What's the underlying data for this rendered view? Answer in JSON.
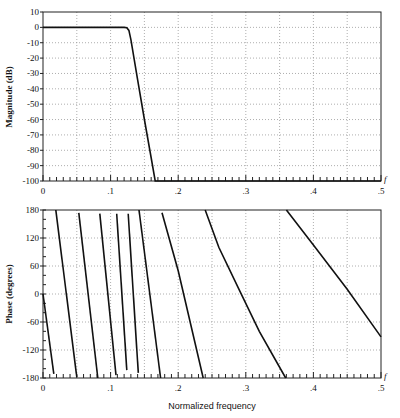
{
  "chart_data": [
    {
      "type": "line",
      "title": "",
      "xlabel": "f",
      "ylabel": "Magnitude (dB)",
      "xlim": [
        0,
        0.5
      ],
      "ylim": [
        -100,
        10
      ],
      "x_ticks": [
        "0",
        ".1",
        ".2",
        ".3",
        ".4",
        ".5"
      ],
      "y_ticks": [
        "10",
        "0",
        "-10",
        "-20",
        "-30",
        "-40",
        "-50",
        "-60",
        "-70",
        "-80",
        "-90",
        "-100"
      ],
      "grid": true,
      "series": [
        {
          "name": "magnitude",
          "points": [
            [
              0,
              0
            ],
            [
              0.12,
              0
            ],
            [
              0.124,
              -0.3
            ],
            [
              0.127,
              -2
            ],
            [
              0.13,
              -8
            ],
            [
              0.14,
              -34
            ],
            [
              0.15,
              -60
            ],
            [
              0.16,
              -85
            ],
            [
              0.166,
              -100
            ],
            [
              0.5,
              -100
            ]
          ]
        }
      ]
    },
    {
      "type": "line",
      "title": "",
      "xlabel": "Normalized frequency",
      "xlabel_end": "f",
      "ylabel": "Phase (degrees)",
      "xlim": [
        0,
        0.5
      ],
      "ylim": [
        -180,
        180
      ],
      "x_ticks": [
        "0",
        ".1",
        ".2",
        ".3",
        ".4",
        ".5"
      ],
      "y_ticks": [
        "180",
        "120",
        "60",
        "0",
        "-60",
        "-120",
        "-180"
      ],
      "grid": true,
      "series": [
        {
          "name": "phase-seg-1",
          "points": [
            [
              0,
              0
            ],
            [
              0.016,
              -171
            ]
          ]
        },
        {
          "name": "phase-seg-2",
          "points": [
            [
              0.019,
              180
            ],
            [
              0.05,
              -178
            ]
          ]
        },
        {
          "name": "phase-seg-3",
          "points": [
            [
              0.053,
              174
            ],
            [
              0.081,
              -180
            ]
          ]
        },
        {
          "name": "phase-seg-4",
          "points": [
            [
              0.084,
              172
            ],
            [
              0.108,
              -174
            ]
          ]
        },
        {
          "name": "phase-seg-5",
          "points": [
            [
              0.109,
              172
            ],
            [
              0.124,
              -163
            ]
          ]
        },
        {
          "name": "phase-seg-6",
          "points": [
            [
              0.126,
              172
            ],
            [
              0.141,
              -169
            ]
          ]
        },
        {
          "name": "phase-seg-7",
          "points": [
            [
              0.142,
              180
            ],
            [
              0.174,
              -180
            ]
          ]
        },
        {
          "name": "phase-seg-8",
          "points": [
            [
              0.176,
              174
            ],
            [
              0.2,
              50
            ],
            [
              0.237,
              -180
            ]
          ]
        },
        {
          "name": "phase-seg-9",
          "points": [
            [
              0.24,
              180
            ],
            [
              0.26,
              100
            ],
            [
              0.29,
              10
            ],
            [
              0.32,
              -80
            ],
            [
              0.359,
              -180
            ]
          ]
        },
        {
          "name": "phase-seg-10",
          "points": [
            [
              0.36,
              180
            ],
            [
              0.4,
              105
            ],
            [
              0.45,
              10
            ],
            [
              0.5,
              -92
            ]
          ]
        }
      ]
    }
  ],
  "labels": {
    "mag_ylabel": "Magnitude (dB)",
    "phase_ylabel": "Phase (degrees)",
    "xlabel": "Normalized frequency",
    "f_symbol": "f"
  }
}
